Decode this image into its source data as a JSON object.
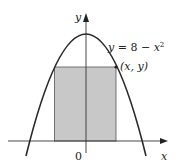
{
  "figure": {
    "type": "inscribed-rectangle-under-parabola",
    "curve_equation": "y = 8 − x²",
    "point_label": "(x, y)",
    "axis_x_label": "x",
    "axis_y_label": "y",
    "origin_label": "0",
    "colors": {
      "curve": "#2a2a2a",
      "axes": "#333333",
      "rectangle_fill": "#c8c8c8",
      "rectangle_stroke": "#555555",
      "background": "#ffffff"
    }
  }
}
